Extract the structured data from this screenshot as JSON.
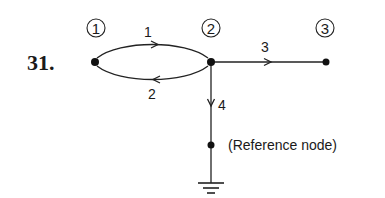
{
  "problem_number": "31.",
  "nodes": [
    {
      "id": "1",
      "label": "1",
      "x": 95,
      "y": 62
    },
    {
      "id": "2",
      "label": "2",
      "x": 211,
      "y": 62
    },
    {
      "id": "3",
      "label": "3",
      "x": 326,
      "y": 62
    },
    {
      "id": "ref",
      "label": "(Reference node)",
      "x": 211,
      "y": 145
    }
  ],
  "branches": [
    {
      "id": "1",
      "label": "1",
      "from": "1",
      "to": "2",
      "shape": "upper-arc",
      "direction": "right"
    },
    {
      "id": "2",
      "label": "2",
      "from": "2",
      "to": "1",
      "shape": "lower-arc",
      "direction": "left"
    },
    {
      "id": "3",
      "label": "3",
      "from": "2",
      "to": "3",
      "shape": "straight",
      "direction": "right"
    },
    {
      "id": "4",
      "label": "4",
      "from": "2",
      "to": "ref",
      "shape": "straight",
      "direction": "down"
    }
  ],
  "reference_node_label": "(Reference node)",
  "ground_symbol": "ground-icon",
  "colors": {
    "ink": "#1a1a1a",
    "background": "#ffffff"
  }
}
